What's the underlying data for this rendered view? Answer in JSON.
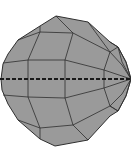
{
  "scene": {
    "subject": "low-poly faceted sphere",
    "colors": {
      "background": "#ffffff",
      "face": "#9a9a9a",
      "edge": "#2f2f2f",
      "equator_dash": "#1a1a1a"
    },
    "equator": {
      "style": "dashed",
      "y": 79
    }
  }
}
